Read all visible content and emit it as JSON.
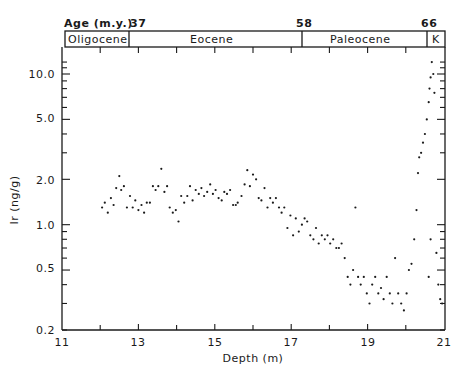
{
  "chart_data": {
    "type": "scatter",
    "title": "",
    "xlabel": "Depth (m)",
    "ylabel": "Ir (ng/g)",
    "xlim": [
      11,
      21
    ],
    "ylim": [
      0.2,
      12
    ],
    "yscale": "log",
    "grid": false,
    "legend": null,
    "x_ticks": [
      11,
      13,
      15,
      17,
      19,
      21
    ],
    "x_tick_labels": [
      "11",
      "13",
      "15",
      "17",
      "19",
      "21"
    ],
    "y_ticks": [
      0.2,
      0.5,
      1.0,
      2.0,
      5.0,
      10.0
    ],
    "y_tick_labels": [
      "0.2",
      "0.5",
      "1.0",
      "2.0",
      "5.0",
      "10.0"
    ],
    "top_axis": {
      "label": "Age (m.y.)",
      "ticks": [
        {
          "label": "37",
          "depth": 12.8
        },
        {
          "label": "58",
          "depth": 17.3
        },
        {
          "label": "66",
          "depth": 21.0
        }
      ],
      "epochs": [
        {
          "name": "Oligocene",
          "from": 11.0,
          "to": 12.8
        },
        {
          "name": "Eocene",
          "from": 12.8,
          "to": 17.3
        },
        {
          "name": "Paleocene",
          "from": 17.3,
          "to": 20.55
        },
        {
          "name": "K",
          "from": 20.55,
          "to": 21.0
        }
      ]
    },
    "series": [
      {
        "name": "Ir",
        "points": [
          [
            12.05,
            1.3
          ],
          [
            12.12,
            1.4
          ],
          [
            12.2,
            1.2
          ],
          [
            12.28,
            1.5
          ],
          [
            12.35,
            1.35
          ],
          [
            12.42,
            1.75
          ],
          [
            12.5,
            2.1
          ],
          [
            12.55,
            1.7
          ],
          [
            12.62,
            1.8
          ],
          [
            12.7,
            1.3
          ],
          [
            12.78,
            1.55
          ],
          [
            12.85,
            1.3
          ],
          [
            12.92,
            1.45
          ],
          [
            13.0,
            1.25
          ],
          [
            13.08,
            1.35
          ],
          [
            13.15,
            1.2
          ],
          [
            13.22,
            1.4
          ],
          [
            13.3,
            1.4
          ],
          [
            13.38,
            1.8
          ],
          [
            13.45,
            1.7
          ],
          [
            13.52,
            1.8
          ],
          [
            13.6,
            2.35
          ],
          [
            13.68,
            1.65
          ],
          [
            13.75,
            1.8
          ],
          [
            13.82,
            1.3
          ],
          [
            13.9,
            1.2
          ],
          [
            13.98,
            1.25
          ],
          [
            14.05,
            1.05
          ],
          [
            14.12,
            1.55
          ],
          [
            14.2,
            1.4
          ],
          [
            14.28,
            1.55
          ],
          [
            14.35,
            1.8
          ],
          [
            14.42,
            1.45
          ],
          [
            14.5,
            1.7
          ],
          [
            14.58,
            1.6
          ],
          [
            14.65,
            1.75
          ],
          [
            14.72,
            1.55
          ],
          [
            14.8,
            1.65
          ],
          [
            14.88,
            1.85
          ],
          [
            14.95,
            1.6
          ],
          [
            15.02,
            1.7
          ],
          [
            15.1,
            1.5
          ],
          [
            15.18,
            1.45
          ],
          [
            15.25,
            1.65
          ],
          [
            15.32,
            1.6
          ],
          [
            15.4,
            1.7
          ],
          [
            15.48,
            1.35
          ],
          [
            15.55,
            1.35
          ],
          [
            15.6,
            1.4
          ],
          [
            15.7,
            1.55
          ],
          [
            15.78,
            1.85
          ],
          [
            15.85,
            2.3
          ],
          [
            15.92,
            1.8
          ],
          [
            16.0,
            2.15
          ],
          [
            16.08,
            2.0
          ],
          [
            16.15,
            1.5
          ],
          [
            16.22,
            1.45
          ],
          [
            16.3,
            1.75
          ],
          [
            16.38,
            1.3
          ],
          [
            16.45,
            1.5
          ],
          [
            16.52,
            1.4
          ],
          [
            16.6,
            1.5
          ],
          [
            16.68,
            1.3
          ],
          [
            16.75,
            1.2
          ],
          [
            16.82,
            1.3
          ],
          [
            16.9,
            0.95
          ],
          [
            16.98,
            1.15
          ],
          [
            17.05,
            0.85
          ],
          [
            17.12,
            1.1
          ],
          [
            17.2,
            0.9
          ],
          [
            17.28,
            1.0
          ],
          [
            17.35,
            1.1
          ],
          [
            17.42,
            1.05
          ],
          [
            17.5,
            0.85
          ],
          [
            17.58,
            0.8
          ],
          [
            17.65,
            0.95
          ],
          [
            17.72,
            0.75
          ],
          [
            17.8,
            0.85
          ],
          [
            17.88,
            0.8
          ],
          [
            17.95,
            0.85
          ],
          [
            18.02,
            0.75
          ],
          [
            18.1,
            0.8
          ],
          [
            18.18,
            0.7
          ],
          [
            18.25,
            0.7
          ],
          [
            18.32,
            0.75
          ],
          [
            18.4,
            0.6
          ],
          [
            18.48,
            0.45
          ],
          [
            18.55,
            0.4
          ],
          [
            18.62,
            0.5
          ],
          [
            18.68,
            1.3
          ],
          [
            18.75,
            0.45
          ],
          [
            18.82,
            0.4
          ],
          [
            18.9,
            0.45
          ],
          [
            18.98,
            0.35
          ],
          [
            19.05,
            0.3
          ],
          [
            19.12,
            0.4
          ],
          [
            19.2,
            0.45
          ],
          [
            19.28,
            0.35
          ],
          [
            19.35,
            0.38
          ],
          [
            19.42,
            0.32
          ],
          [
            19.5,
            0.45
          ],
          [
            19.58,
            0.35
          ],
          [
            19.65,
            0.3
          ],
          [
            19.72,
            0.6
          ],
          [
            19.8,
            0.35
          ],
          [
            19.88,
            0.3
          ],
          [
            19.95,
            0.27
          ],
          [
            20.02,
            0.35
          ],
          [
            20.08,
            0.5
          ],
          [
            20.15,
            0.55
          ],
          [
            20.22,
            0.8
          ],
          [
            20.28,
            1.25
          ],
          [
            20.32,
            2.2
          ],
          [
            20.35,
            2.8
          ],
          [
            20.4,
            3.0
          ],
          [
            20.45,
            3.5
          ],
          [
            20.5,
            4.0
          ],
          [
            20.55,
            5.0
          ],
          [
            20.6,
            6.5
          ],
          [
            20.62,
            8.0
          ],
          [
            20.65,
            9.5
          ],
          [
            20.68,
            12.0
          ],
          [
            20.72,
            10.0
          ],
          [
            20.75,
            7.5
          ],
          [
            20.8,
            0.65
          ],
          [
            20.85,
            0.4
          ],
          [
            20.9,
            0.32
          ],
          [
            20.95,
            0.3
          ],
          [
            20.65,
            0.8
          ],
          [
            20.6,
            0.45
          ]
        ]
      }
    ]
  },
  "labels": {
    "age_label": "Age (m.y.)",
    "age_37": "37",
    "age_58": "58",
    "age_66": "66",
    "epoch_oligocene": "Oligocene",
    "epoch_eocene": "Eocene",
    "epoch_paleocene": "Paleocene",
    "epoch_k": "K",
    "xlabel": "Depth (m)",
    "ylabel": "Ir (ng/g)",
    "x_ticks": [
      "11",
      "13",
      "15",
      "17",
      "19",
      "21"
    ],
    "y_ticks": [
      "10.0",
      "5.0",
      "2.0",
      "1.0",
      "0.5",
      "0.2"
    ]
  }
}
